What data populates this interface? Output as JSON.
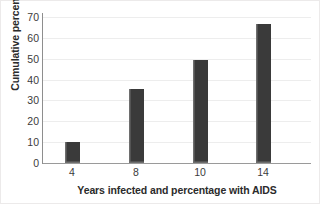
{
  "chart_data": {
    "type": "bar",
    "title": "",
    "xlabel": "Years infected and percentage with AIDS",
    "ylabel": "Cumulative percentage",
    "categories": [
      "4",
      "8",
      "10",
      "14"
    ],
    "values": [
      10,
      35.5,
      49.5,
      66.5
    ],
    "series": [
      {
        "name": "Cumulative percentage with AIDS",
        "values": [
          10,
          35.5,
          49.5,
          66.5
        ]
      }
    ],
    "ylim": [
      0,
      70
    ],
    "ytick_labels": [
      "0",
      "10",
      "20",
      "30",
      "40",
      "50",
      "60",
      "70"
    ],
    "ytick_values": [
      0,
      10,
      20,
      30,
      40,
      50,
      60,
      70
    ],
    "xtick_labels": [
      "4",
      "8",
      "10",
      "14"
    ],
    "grid": "horizontal",
    "legend": "none",
    "bar_color": "#3a3a3a",
    "bar_edge_color": "#6f6f6f",
    "gridline_color": "#ededed",
    "axis_color": "#8e8e8e",
    "background_color": "#ffffff",
    "annotations": []
  }
}
